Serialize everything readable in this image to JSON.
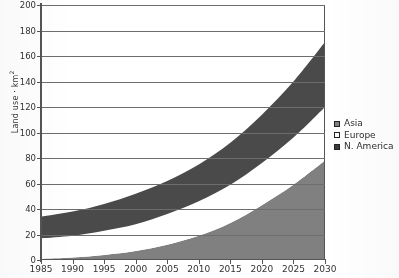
{
  "chart_data": {
    "type": "area",
    "stacked": true,
    "title": "",
    "xlabel": "",
    "ylabel": "Land use · km",
    "ylabel_superscript": "2",
    "x": [
      1985,
      1990,
      1995,
      2000,
      2005,
      2010,
      2015,
      2020,
      2025,
      2030
    ],
    "xtick_labels": [
      "1985",
      "1990",
      "1995",
      "2000",
      "2005",
      "2010",
      "2015",
      "2020",
      "2025",
      "2030"
    ],
    "ytick_labels": [
      "0",
      "20",
      "40",
      "60",
      "80",
      "100",
      "120",
      "140",
      "160",
      "180",
      "200"
    ],
    "ytick_values": [
      0,
      20,
      40,
      60,
      80,
      100,
      120,
      140,
      160,
      180,
      200
    ],
    "ylim": [
      0,
      200
    ],
    "xlim": [
      1985,
      2030
    ],
    "grid": true,
    "grid_axis": "y",
    "legend_position": "right",
    "series": [
      {
        "name": "Asia",
        "color": "#808080",
        "values": [
          1,
          2,
          4,
          7,
          12,
          19,
          29,
          43,
          59,
          78
        ]
      },
      {
        "name": "Europe",
        "color": "#ffffff",
        "values": [
          16,
          17,
          19,
          21,
          24,
          27,
          30,
          33,
          37,
          42
        ]
      },
      {
        "name": "N. America",
        "color": "#4a4a4a",
        "values": [
          17,
          19,
          21,
          24,
          26,
          29,
          33,
          38,
          44,
          51
        ]
      }
    ],
    "cumulative": {
      "asia": [
        1,
        2,
        4,
        7,
        12,
        19,
        29,
        43,
        59,
        78
      ],
      "europe": [
        17,
        19,
        23,
        28,
        36,
        46,
        59,
        76,
        96,
        120
      ],
      "n_america": [
        34,
        38,
        44,
        52,
        62,
        75,
        92,
        114,
        140,
        171
      ]
    },
    "legend": [
      {
        "label": "Asia",
        "swatch": "#808080"
      },
      {
        "label": "Europe",
        "swatch": "#ffffff"
      },
      {
        "label": "N. America",
        "swatch": "#3c3c3c"
      }
    ]
  }
}
